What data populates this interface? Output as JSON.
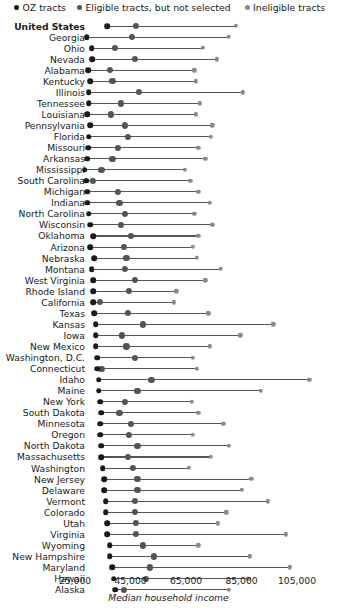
{
  "legend": {
    "items": [
      {
        "label": "OZ tracts",
        "color": "#1a1a1a",
        "icon": "dot-icon"
      },
      {
        "label": "Eligible tracts, but not selected",
        "color": "#545454",
        "icon": "dot-icon"
      },
      {
        "label": "Ineligible tracts",
        "color": "#8a8a8a",
        "icon": "dot-icon"
      }
    ]
  },
  "axis": {
    "title": "Median household income",
    "ticks": [
      {
        "value": 25000,
        "label": "25,000"
      },
      {
        "value": 45000,
        "label": "45,000"
      },
      {
        "value": 65000,
        "label": "65,000"
      },
      {
        "value": 85000,
        "label": "85,000"
      },
      {
        "value": 105000,
        "label": "105,000"
      }
    ]
  },
  "chart_data": {
    "type": "scatter",
    "title": "",
    "subtitle": "",
    "xlabel": "Median household income",
    "ylabel": "",
    "xlim": [
      20000,
      115000
    ],
    "grid": false,
    "legend_position": "top",
    "series": [
      {
        "name": "OZ tracts",
        "color": "#1a1a1a"
      },
      {
        "name": "Eligible tracts, but not selected",
        "color": "#545454"
      },
      {
        "name": "Ineligible tracts",
        "color": "#8a8a8a"
      }
    ],
    "categories": [
      "United States",
      "Georgia",
      "Ohio",
      "Nevada",
      "Alabama",
      "Kentucky",
      "Illinois",
      "Tennessee",
      "Louisiana",
      "Pennsylvania",
      "Florida",
      "Missouri",
      "Arkansas",
      "Mississippi",
      "South Carolina",
      "Michigan",
      "Indiana",
      "North Carolina",
      "Wisconsin",
      "Oklahoma",
      "Arizona",
      "Nebraska",
      "Montana",
      "West Virginia",
      "Rhode Island",
      "California",
      "Texas",
      "Kansas",
      "Iowa",
      "New Mexico",
      "Washington, D.C.",
      "Connecticut",
      "Idaho",
      "Maine",
      "New York",
      "South Dakota",
      "Minnesota",
      "Oregon",
      "North Dakota",
      "Massachusetts",
      "Washington",
      "New Jersey",
      "Delaware",
      "Vermont",
      "Colorado",
      "Utah",
      "Virginia",
      "Wyoming",
      "New Hampshire",
      "Maryland",
      "Hawaii",
      "Alaska"
    ],
    "rows": [
      {
        "state": "United States",
        "oz": 36500,
        "eligible": 47000,
        "ineligible": 83000
      },
      {
        "state": "Georgia",
        "oz": 29200,
        "eligible": 45500,
        "ineligible": 80500
      },
      {
        "state": "Ohio",
        "oz": 31000,
        "eligible": 39500,
        "ineligible": 71000
      },
      {
        "state": "Nevada",
        "oz": 31200,
        "eligible": 46500,
        "ineligible": 76000
      },
      {
        "state": "Alabama",
        "oz": 29800,
        "eligible": 37500,
        "ineligible": 68000
      },
      {
        "state": "Kentucky",
        "oz": 30500,
        "eligible": 38500,
        "ineligible": 68500
      },
      {
        "state": "Illinois",
        "oz": 30000,
        "eligible": 48000,
        "ineligible": 85500
      },
      {
        "state": "Tennessee",
        "oz": 30000,
        "eligible": 41500,
        "ineligible": 70000
      },
      {
        "state": "Louisiana",
        "oz": 29500,
        "eligible": 38000,
        "ineligible": 68500
      },
      {
        "state": "Pennsylvania",
        "oz": 30500,
        "eligible": 43000,
        "ineligible": 74500
      },
      {
        "state": "Florida",
        "oz": 30000,
        "eligible": 44000,
        "ineligible": 74000
      },
      {
        "state": "Missouri",
        "oz": 29800,
        "eligible": 40500,
        "ineligible": 69500
      },
      {
        "state": "Arkansas",
        "oz": 29500,
        "eligible": 38500,
        "ineligible": 72000
      },
      {
        "state": "Mississippi",
        "oz": 28500,
        "eligible": 34500,
        "ineligible": 64500
      },
      {
        "state": "South Carolina",
        "oz": 29000,
        "eligible": 31500,
        "ineligible": 66500
      },
      {
        "state": "Michigan",
        "oz": 29500,
        "eligible": 40500,
        "ineligible": 69500
      },
      {
        "state": "Indiana",
        "oz": 29500,
        "eligible": 41000,
        "ineligible": 73500
      },
      {
        "state": "North Carolina",
        "oz": 30000,
        "eligible": 43000,
        "ineligible": 68000
      },
      {
        "state": "Wisconsin",
        "oz": 30500,
        "eligible": 41500,
        "ineligible": 74500
      },
      {
        "state": "Oklahoma",
        "oz": 31500,
        "eligible": 45000,
        "ineligible": 69500
      },
      {
        "state": "Arizona",
        "oz": 30500,
        "eligible": 42500,
        "ineligible": 67500
      },
      {
        "state": "Nebraska",
        "oz": 32000,
        "eligible": 43500,
        "ineligible": 69000
      },
      {
        "state": "Montana",
        "oz": 31000,
        "eligible": 43000,
        "ineligible": 77500
      },
      {
        "state": "West Virginia",
        "oz": 31500,
        "eligible": 46500,
        "ineligible": 72000
      },
      {
        "state": "Rhode Island",
        "oz": 31500,
        "eligible": 44500,
        "ineligible": 61500
      },
      {
        "state": "California",
        "oz": 31500,
        "eligible": 34000,
        "ineligible": 60500
      },
      {
        "state": "Texas",
        "oz": 32000,
        "eligible": 44000,
        "ineligible": 73000
      },
      {
        "state": "Kansas",
        "oz": 32500,
        "eligible": 49500,
        "ineligible": 96500
      },
      {
        "state": "Iowa",
        "oz": 32500,
        "eligible": 42000,
        "ineligible": 84500
      },
      {
        "state": "New Mexico",
        "oz": 32500,
        "eligible": 43500,
        "ineligible": 73500
      },
      {
        "state": "Washington, D.C.",
        "oz": 33000,
        "eligible": 46500,
        "ineligible": 67500
      },
      {
        "state": "Connecticut",
        "oz": 33000,
        "eligible": 34500,
        "ineligible": 69000
      },
      {
        "state": "Idaho",
        "oz": 33500,
        "eligible": 52500,
        "ineligible": 109500
      },
      {
        "state": "Maine",
        "oz": 33500,
        "eligible": 47500,
        "ineligible": 92000
      },
      {
        "state": "New York",
        "oz": 34000,
        "eligible": 43000,
        "ineligible": 67000
      },
      {
        "state": "South Dakota",
        "oz": 34500,
        "eligible": 41000,
        "ineligible": 69500
      },
      {
        "state": "Minnesota",
        "oz": 34000,
        "eligible": 45000,
        "ineligible": 78500
      },
      {
        "state": "Oregon",
        "oz": 34000,
        "eligible": 44500,
        "ineligible": 67500
      },
      {
        "state": "North Dakota",
        "oz": 34500,
        "eligible": 47500,
        "ineligible": 80500
      },
      {
        "state": "Massachusetts",
        "oz": 34500,
        "eligible": 44000,
        "ineligible": 74000
      },
      {
        "state": "Washington",
        "oz": 35000,
        "eligible": 46000,
        "ineligible": 66000
      },
      {
        "state": "New Jersey",
        "oz": 35500,
        "eligible": 47500,
        "ineligible": 88500
      },
      {
        "state": "Delaware",
        "oz": 35500,
        "eligible": 47500,
        "ineligible": 85000
      },
      {
        "state": "Vermont",
        "oz": 36000,
        "eligible": 46500,
        "ineligible": 94500
      },
      {
        "state": "Colorado",
        "oz": 36000,
        "eligible": 46500,
        "ineligible": 79500
      },
      {
        "state": "Utah",
        "oz": 36500,
        "eligible": 47000,
        "ineligible": 76500
      },
      {
        "state": "Virginia",
        "oz": 36500,
        "eligible": 47000,
        "ineligible": 101000
      },
      {
        "state": "Wyoming",
        "oz": 37500,
        "eligible": 49500,
        "ineligible": 69500
      },
      {
        "state": "New Hampshire",
        "oz": 37500,
        "eligible": 53500,
        "ineligible": 88000
      },
      {
        "state": "Maryland",
        "oz": 38500,
        "eligible": 52000,
        "ineligible": 102500
      },
      {
        "state": "Hawaii",
        "oz": 39000,
        "eligible": 50500,
        "ineligible": 87500
      },
      {
        "state": "Alaska",
        "oz": 39500,
        "eligible": 42500,
        "ineligible": 80500
      }
    ]
  }
}
